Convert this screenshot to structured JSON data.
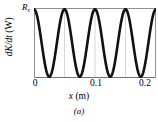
{
  "figure": {
    "caption": "(a)"
  },
  "axes": {
    "ylabel_italic": "dK/dt",
    "ylabel_unit": "(W)",
    "ytick_top_symbol": "R",
    "ytick_top_subscript": "s",
    "xlabel_symbol": "x",
    "xlabel_unit": "(m)",
    "xticks": [
      "0",
      "0.1",
      "0.2"
    ]
  },
  "style": {
    "curve_color": "#111111",
    "frame_color": "#8a8a8a",
    "grid_color": "#c8c8c8",
    "background": "#ffffff"
  },
  "chart_data": {
    "type": "line",
    "title": "",
    "subtitle": "",
    "xlabel": "x (m)",
    "ylabel": "dK/dt (W)",
    "xlim": [
      0,
      0.2
    ],
    "ylim": [
      0,
      1
    ],
    "xticks": [
      0,
      0.1,
      0.2
    ],
    "xticklabels": [
      "0",
      "0.1",
      "0.2"
    ],
    "yticks": [
      1
    ],
    "yticklabels": [
      "R_s"
    ],
    "grid": "vertical-only",
    "legend": "none",
    "annotations": [
      "(a)"
    ],
    "series": [
      {
        "name": "dK/dt",
        "formula": "R_s * cos(2*pi*x/0.1)^2",
        "period": 0.1,
        "amplitude_label": "R_s",
        "maxima_x": [
          0,
          0.1,
          0.2
        ],
        "maxima_y": [
          1,
          1,
          1
        ],
        "minima_x": [
          0.05,
          0.15
        ],
        "minima_y": [
          0,
          0
        ],
        "x": [
          0,
          0.005,
          0.01,
          0.015,
          0.02,
          0.025,
          0.03,
          0.035,
          0.04,
          0.045,
          0.05,
          0.055,
          0.06,
          0.065,
          0.07,
          0.075,
          0.08,
          0.085,
          0.09,
          0.095,
          0.1,
          0.105,
          0.11,
          0.115,
          0.12,
          0.125,
          0.13,
          0.135,
          0.14,
          0.145,
          0.15,
          0.155,
          0.16,
          0.165,
          0.17,
          0.175,
          0.18,
          0.185,
          0.19,
          0.195,
          0.2
        ],
        "values": [
          1,
          0.976,
          0.905,
          0.794,
          0.655,
          0.5,
          0.345,
          0.206,
          0.095,
          0.024,
          0,
          0.024,
          0.095,
          0.206,
          0.345,
          0.5,
          0.655,
          0.794,
          0.905,
          0.976,
          1,
          0.976,
          0.905,
          0.794,
          0.655,
          0.5,
          0.345,
          0.206,
          0.095,
          0.024,
          0,
          0.024,
          0.095,
          0.206,
          0.345,
          0.5,
          0.655,
          0.794,
          0.905,
          0.976,
          1
        ]
      }
    ]
  }
}
